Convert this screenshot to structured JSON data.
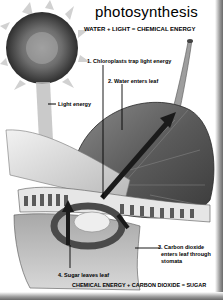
{
  "diagram": {
    "title": "photosynthesis",
    "equation_top": "WATER + LIGHT = CHEMICAL ENERGY",
    "equation_bottom": "CHEMICAL ENERGY + CARBON DIOXIDE = SUGAR",
    "labels": {
      "light_energy": "Light energy",
      "step1": "1. Chloroplasts trap light energy",
      "step2": "2. Water enters leaf",
      "step3_line1": "3. Carbon dioxide",
      "step3_line2": "enters leaf through",
      "step3_line3": "stomata",
      "step4": "4. Sugar leaves leaf"
    },
    "icons": [
      "sun-icon",
      "leaf-icon",
      "leaf-cross-section-icon",
      "arrow-icon"
    ],
    "colors": {
      "background": "#ffffff",
      "ink": "#000000",
      "leaf_dark": "#4a4a4a",
      "leaf_light": "#cfcfcf"
    }
  }
}
